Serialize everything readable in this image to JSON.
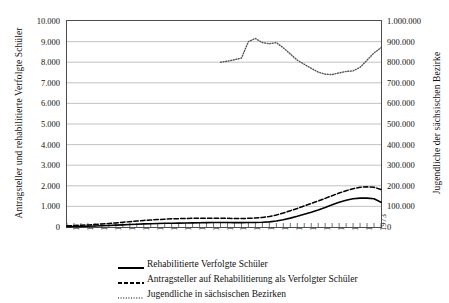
{
  "chart_data": {
    "type": "line",
    "title": "",
    "xlabel": "",
    "ylabel": "Antragsteller und rehabilitierte Verfolgte Schüler",
    "y2label": "Jugendliche der sächsischen Bezirke",
    "grid": true,
    "legend_position": "bottom",
    "ylim": [
      0,
      10000
    ],
    "y2lim": [
      0,
      1000000
    ],
    "xlim": [
      1929,
      1974
    ],
    "yticks": [
      "0",
      "1.000",
      "2.000",
      "3.000",
      "4.000",
      "5.000",
      "6.000",
      "7.000",
      "8.000",
      "9.000",
      "10.000"
    ],
    "y2ticks": [
      "0",
      "100.000",
      "200.000",
      "300.000",
      "400.000",
      "500.000",
      "600.000",
      "700.000",
      "800.000",
      "900.000",
      "1.000.000"
    ],
    "xticks": [
      "1929",
      "1931",
      "1933",
      "1935",
      "1937",
      "1939",
      "1941",
      "1943",
      "1945",
      "1947",
      "1949",
      "1951",
      "1953",
      "1955",
      "1957",
      "1959",
      "1961",
      "1963",
      "1965",
      "1967",
      "1969",
      "1971",
      "1973"
    ],
    "series": [
      {
        "name": "Rehabilitierte Verfolgte Schüler",
        "style": "solid",
        "axis": "left",
        "color": "#000000",
        "x": [
          1929,
          1930,
          1931,
          1932,
          1933,
          1934,
          1935,
          1936,
          1937,
          1938,
          1939,
          1940,
          1941,
          1942,
          1943,
          1944,
          1945,
          1946,
          1947,
          1948,
          1949,
          1950,
          1951,
          1952,
          1953,
          1954,
          1955,
          1956,
          1957,
          1958,
          1959,
          1960,
          1961,
          1962,
          1963,
          1964,
          1965,
          1966,
          1967,
          1968,
          1969,
          1970,
          1971,
          1972,
          1973,
          1974
        ],
        "values": [
          20,
          25,
          30,
          40,
          50,
          60,
          75,
          90,
          105,
          120,
          135,
          150,
          160,
          170,
          180,
          185,
          190,
          195,
          200,
          205,
          210,
          215,
          215,
          215,
          210,
          210,
          215,
          220,
          230,
          250,
          290,
          350,
          430,
          520,
          620,
          720,
          830,
          950,
          1080,
          1200,
          1300,
          1370,
          1400,
          1400,
          1370,
          1200
        ]
      },
      {
        "name": "Antragsteller auf Rehabilitierung als Verfolgter Schüler",
        "style": "dashed",
        "axis": "left",
        "color": "#000000",
        "x": [
          1929,
          1930,
          1931,
          1932,
          1933,
          1934,
          1935,
          1936,
          1937,
          1938,
          1939,
          1940,
          1941,
          1942,
          1943,
          1944,
          1945,
          1946,
          1947,
          1948,
          1949,
          1950,
          1951,
          1952,
          1953,
          1954,
          1955,
          1956,
          1957,
          1958,
          1959,
          1960,
          1961,
          1962,
          1963,
          1964,
          1965,
          1966,
          1967,
          1968,
          1969,
          1970,
          1971,
          1972,
          1973,
          1974
        ],
        "values": [
          60,
          70,
          85,
          100,
          120,
          145,
          170,
          200,
          230,
          260,
          290,
          320,
          340,
          360,
          380,
          395,
          405,
          415,
          420,
          425,
          430,
          430,
          425,
          420,
          415,
          415,
          420,
          435,
          460,
          510,
          580,
          680,
          790,
          900,
          1020,
          1140,
          1260,
          1390,
          1520,
          1650,
          1760,
          1860,
          1930,
          1950,
          1930,
          1820
        ]
      },
      {
        "name": "Jugendliche in sächsischen Bezirken",
        "style": "dotted",
        "axis": "right",
        "color": "#555555",
        "x": [
          1951,
          1952,
          1953,
          1954,
          1955,
          1956,
          1957,
          1958,
          1959,
          1960,
          1961,
          1962,
          1963,
          1964,
          1965,
          1966,
          1967,
          1968,
          1969,
          1970,
          1971,
          1972,
          1973,
          1974
        ],
        "values": [
          800000,
          805000,
          812000,
          820000,
          900000,
          915000,
          895000,
          890000,
          895000,
          870000,
          840000,
          810000,
          790000,
          770000,
          752000,
          742000,
          740000,
          748000,
          755000,
          758000,
          775000,
          810000,
          845000,
          870000
        ]
      }
    ]
  },
  "legend": {
    "items": [
      {
        "label": "Rehabilitierte Verfolgte Schüler",
        "style": "solid"
      },
      {
        "label": "Antragsteller auf Rehabilitierung als Verfolgter Schüler",
        "style": "dashed"
      },
      {
        "label": "Jugendliche in sächsischen Bezirken",
        "style": "dotted"
      }
    ]
  }
}
